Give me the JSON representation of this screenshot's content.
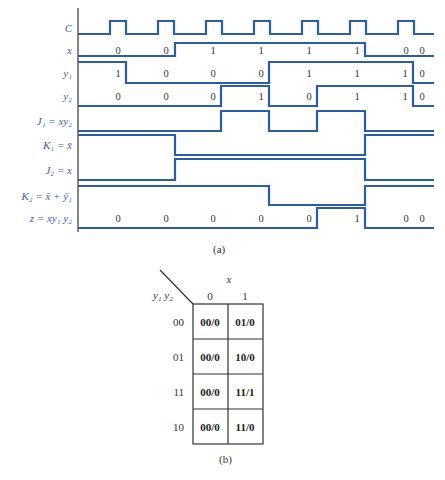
{
  "figure_a": {
    "caption": "(a)",
    "axis_x": 78,
    "axis_top": 8,
    "axis_bottom": 232,
    "x_end": 434,
    "signals": [
      {
        "id": "C",
        "label": "C",
        "hi": 21,
        "lo": 34,
        "edges": [
          78,
          110,
          126,
          158,
          174,
          206,
          222,
          254,
          270,
          302,
          318,
          350,
          366,
          398,
          414,
          434
        ],
        "levels": [
          0,
          1,
          0,
          1,
          0,
          1,
          0,
          1,
          0,
          1,
          0,
          1,
          0,
          1,
          0
        ],
        "values": []
      },
      {
        "id": "x",
        "label": "x",
        "hi": 43,
        "lo": 56,
        "edges": [
          78,
          175,
          365,
          434
        ],
        "levels": [
          0,
          1,
          0
        ],
        "values": [
          {
            "x": 118,
            "t": "0"
          },
          {
            "x": 166,
            "t": "0"
          },
          {
            "x": 213,
            "t": "1"
          },
          {
            "x": 261,
            "t": "1"
          },
          {
            "x": 309,
            "t": "1"
          },
          {
            "x": 357,
            "t": "1"
          },
          {
            "x": 406,
            "t": "0"
          },
          {
            "x": 422,
            "t": "0"
          }
        ]
      },
      {
        "id": "y1",
        "label": "y₁",
        "hi": 62,
        "lo": 83,
        "edges": [
          78,
          126,
          269,
          413,
          434
        ],
        "levels": [
          1,
          0,
          1,
          0
        ],
        "values": [
          {
            "x": 118,
            "t": "1"
          },
          {
            "x": 166,
            "t": "0"
          },
          {
            "x": 213,
            "t": "0"
          },
          {
            "x": 261,
            "t": "0"
          },
          {
            "x": 309,
            "t": "1"
          },
          {
            "x": 357,
            "t": "1"
          },
          {
            "x": 405,
            "t": "1"
          },
          {
            "x": 422,
            "t": "0"
          }
        ]
      },
      {
        "id": "y2",
        "label": "y₂",
        "hi": 86,
        "lo": 106,
        "edges": [
          78,
          221,
          269,
          317,
          413,
          434
        ],
        "levels": [
          0,
          1,
          0,
          1,
          0
        ],
        "values": [
          {
            "x": 118,
            "t": "0"
          },
          {
            "x": 166,
            "t": "0"
          },
          {
            "x": 213,
            "t": "0"
          },
          {
            "x": 261,
            "t": "1"
          },
          {
            "x": 309,
            "t": "0"
          },
          {
            "x": 357,
            "t": "1"
          },
          {
            "x": 405,
            "t": "1"
          },
          {
            "x": 422,
            "t": "0"
          }
        ]
      },
      {
        "id": "J1",
        "label": "J₁ = xy₂",
        "hi": 111,
        "lo": 131,
        "edges": [
          78,
          221,
          269,
          317,
          365,
          434
        ],
        "levels": [
          0,
          1,
          0,
          1,
          0
        ],
        "values": []
      },
      {
        "id": "K1",
        "label": "K₁ = x̄",
        "hi": 135,
        "lo": 155,
        "edges": [
          78,
          175,
          365,
          434
        ],
        "levels": [
          1,
          0,
          1
        ],
        "values": []
      },
      {
        "id": "J2",
        "label": "J₂ = x",
        "hi": 159,
        "lo": 180,
        "edges": [
          78,
          175,
          365,
          434
        ],
        "levels": [
          0,
          1,
          0
        ],
        "values": []
      },
      {
        "id": "K2",
        "label": "K₂ = x̄ + ȳ₁",
        "hi": 186,
        "lo": 205,
        "edges": [
          78,
          269,
          365,
          434
        ],
        "levels": [
          1,
          0,
          1
        ],
        "values": []
      },
      {
        "id": "z",
        "label": "z = xy₁ y₂",
        "hi": 208,
        "lo": 228,
        "edges": [
          78,
          317,
          365,
          434
        ],
        "levels": [
          0,
          1,
          0
        ],
        "values": [
          {
            "x": 118,
            "t": "0"
          },
          {
            "x": 166,
            "t": "0"
          },
          {
            "x": 213,
            "t": "0"
          },
          {
            "x": 261,
            "t": "0"
          },
          {
            "x": 309,
            "t": "0"
          },
          {
            "x": 357,
            "t": "1"
          },
          {
            "x": 406,
            "t": "0"
          },
          {
            "x": 422,
            "t": "0"
          }
        ]
      }
    ]
  },
  "figure_b": {
    "caption": "(b)",
    "column_variable": "x",
    "row_variable": "y₁ y₂",
    "columns": [
      "0",
      "1"
    ],
    "rows": [
      {
        "label": "00",
        "cells": [
          "00/0",
          "01/0"
        ]
      },
      {
        "label": "01",
        "cells": [
          "00/0",
          "10/0"
        ]
      },
      {
        "label": "11",
        "cells": [
          "00/0",
          "11/1"
        ]
      },
      {
        "label": "10",
        "cells": [
          "00/0",
          "11/0"
        ]
      }
    ]
  },
  "colors": {
    "waveform": "#2b5cab",
    "label": "#3a5ea8",
    "text": "#333333"
  }
}
